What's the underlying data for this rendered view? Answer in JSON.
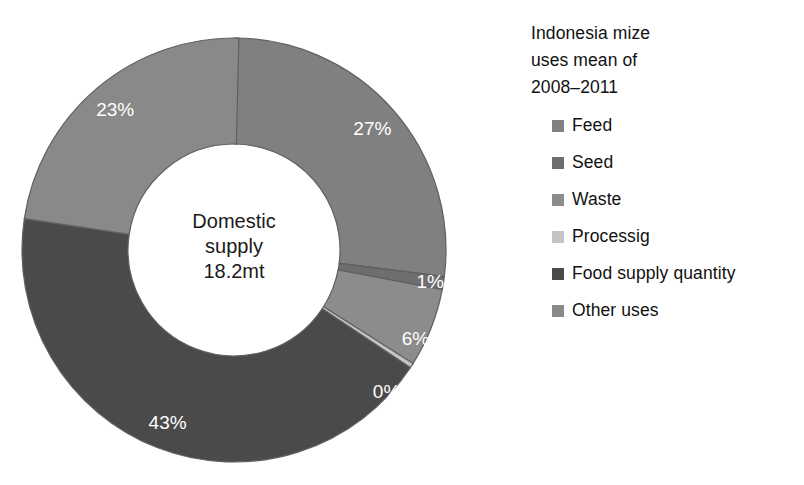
{
  "chart_data": {
    "type": "pie",
    "variant": "donut",
    "title": "Indonesia mize uses mean of 2008–2011",
    "title_lines": [
      "Indonesia mize",
      "uses mean of",
      "2008–2011"
    ],
    "center_label_lines": [
      "Domestic",
      "supply",
      "18.2mt"
    ],
    "center_total_value": "18.2mt",
    "center_total_caption": "Domestic supply",
    "units": "percent of domestic supply",
    "start_angle_deg": 0,
    "direction": "clockwise",
    "hole_ratio": 0.5,
    "legend_position": "right",
    "categories": [
      "Feed",
      "Seed",
      "Waste",
      "Processig",
      "Food supply quantity",
      "Other uses"
    ],
    "values": [
      27,
      1,
      6,
      0,
      43,
      23
    ],
    "data_labels": [
      "27%",
      "1%",
      "6%",
      "0%",
      "43%",
      "23%"
    ],
    "colors": [
      "#808080",
      "#6e6e6e",
      "#8c8c8c",
      "#c4c4c4",
      "#4a4a4a",
      "#898989"
    ],
    "slices": [
      {
        "name": "Feed",
        "value": 27,
        "label": "27%",
        "color": "#808080"
      },
      {
        "name": "Seed",
        "value": 1,
        "label": "1%",
        "color": "#6e6e6e"
      },
      {
        "name": "Waste",
        "value": 6,
        "label": "6%",
        "color": "#8c8c8c"
      },
      {
        "name": "Processig",
        "value": 0,
        "label": "0%",
        "color": "#c4c4c4"
      },
      {
        "name": "Food supply quantity",
        "value": 43,
        "label": "43%",
        "color": "#4a4a4a"
      },
      {
        "name": "Other uses",
        "value": 23,
        "label": "23%",
        "color": "#898989"
      }
    ],
    "xlabel": "",
    "ylabel": "",
    "grid": false
  },
  "legend": {
    "title": "Indonesia mize\nuses mean of\n2008–2011",
    "items": [
      {
        "label": "Feed",
        "color": "#808080"
      },
      {
        "label": "Seed",
        "color": "#6e6e6e"
      },
      {
        "label": "Waste",
        "color": "#8c8c8c"
      },
      {
        "label": "Processig",
        "color": "#c4c4c4"
      },
      {
        "label": "Food supply quantity",
        "color": "#4a4a4a"
      },
      {
        "label": "Other uses",
        "color": "#898989"
      }
    ]
  },
  "donut": {
    "center_lines": [
      "Domestic",
      "supply",
      "18.2mt"
    ],
    "labels": {
      "feed": "27%",
      "seed": "1%",
      "waste": "6%",
      "processig": "0%",
      "food_supply_quantity": "43%",
      "other_uses": "23%"
    }
  }
}
